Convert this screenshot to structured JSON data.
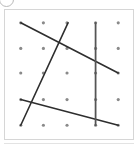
{
  "figure": {
    "type": "lattice-line-diagram",
    "frame": {
      "x": 4,
      "y": 9,
      "width": 130,
      "height": 131,
      "border_color": "#d6d6d6",
      "background_color": "#ffffff"
    },
    "corner_marker": {
      "name": "cropped-circle-marker",
      "shape": "circle",
      "color": "#b9b9b9"
    },
    "grid": {
      "rows": 5,
      "cols": 5,
      "dot_color": "#8a8a8a",
      "dot_radius": 1.6,
      "x_positions": [
        20,
        43,
        67,
        96,
        119
      ],
      "y_positions": [
        22,
        48,
        73,
        100,
        126
      ],
      "dots": [
        {
          "x": 20,
          "y": 22
        },
        {
          "x": 43,
          "y": 22
        },
        {
          "x": 67,
          "y": 22
        },
        {
          "x": 96,
          "y": 22
        },
        {
          "x": 119,
          "y": 22
        },
        {
          "x": 20,
          "y": 48
        },
        {
          "x": 43,
          "y": 48
        },
        {
          "x": 67,
          "y": 48
        },
        {
          "x": 96,
          "y": 48
        },
        {
          "x": 119,
          "y": 48
        },
        {
          "x": 20,
          "y": 73
        },
        {
          "x": 43,
          "y": 73
        },
        {
          "x": 67,
          "y": 73
        },
        {
          "x": 96,
          "y": 73
        },
        {
          "x": 119,
          "y": 73
        },
        {
          "x": 20,
          "y": 100
        },
        {
          "x": 43,
          "y": 100
        },
        {
          "x": 67,
          "y": 100
        },
        {
          "x": 96,
          "y": 100
        },
        {
          "x": 119,
          "y": 100
        },
        {
          "x": 20,
          "y": 126
        },
        {
          "x": 43,
          "y": 126
        },
        {
          "x": 67,
          "y": 126
        },
        {
          "x": 96,
          "y": 126
        },
        {
          "x": 119,
          "y": 126
        }
      ]
    },
    "segments": [
      {
        "name": "descending-diagonal",
        "x1": 20,
        "y1": 22,
        "x2": 119,
        "y2": 73,
        "color": "#2e2e2e",
        "width": 1.6
      },
      {
        "name": "steep-rising-diagonal",
        "x1": 20,
        "y1": 126,
        "x2": 68,
        "y2": 22,
        "color": "#2e2e2e",
        "width": 1.6
      },
      {
        "name": "shallow-descending-line",
        "x1": 20,
        "y1": 100,
        "x2": 119,
        "y2": 126,
        "color": "#2e2e2e",
        "width": 1.6
      },
      {
        "name": "vertical-line",
        "x1": 96,
        "y1": 22,
        "x2": 96,
        "y2": 126,
        "color": "#555555",
        "width": 1.8
      }
    ],
    "baseline_rule_color": "#e3e3e3"
  }
}
